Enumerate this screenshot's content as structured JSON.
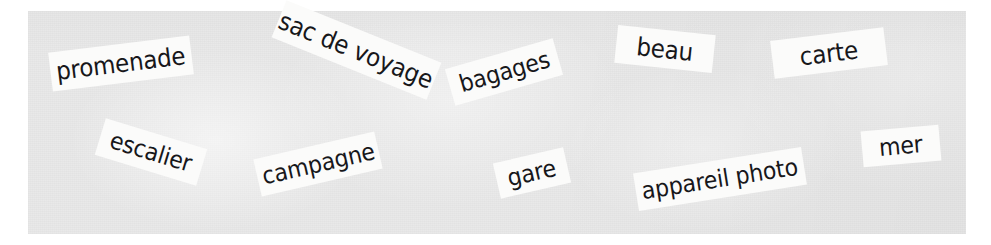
{
  "image": {
    "title": "French vocabulary word cards on grey paper",
    "background_color": "#ffffff",
    "paper_color": "#e9e9e9",
    "card_color": "#fbfbfa",
    "text_color": "#17171a"
  },
  "cards": [
    {
      "label": "promenade",
      "left": 50,
      "top": 44,
      "width": 142,
      "height": 39,
      "rotation": -7,
      "font_size": 25
    },
    {
      "label": "sac de voyage",
      "left": 273,
      "top": 30,
      "width": 167,
      "height": 40,
      "rotation": 22,
      "font_size": 25
    },
    {
      "label": "bagages",
      "left": 448,
      "top": 53,
      "width": 112,
      "height": 38,
      "rotation": -16,
      "font_size": 24
    },
    {
      "label": "beau",
      "left": 616,
      "top": 30,
      "width": 98,
      "height": 38,
      "rotation": 6,
      "font_size": 25
    },
    {
      "label": "carte",
      "left": 772,
      "top": 34,
      "width": 114,
      "height": 38,
      "rotation": -7,
      "font_size": 25
    },
    {
      "label": "escalier",
      "left": 98,
      "top": 133,
      "width": 106,
      "height": 38,
      "rotation": 17,
      "font_size": 24
    },
    {
      "label": "campagne",
      "left": 256,
      "top": 145,
      "width": 124,
      "height": 38,
      "rotation": -13,
      "font_size": 24
    },
    {
      "label": "gare",
      "left": 496,
      "top": 155,
      "width": 72,
      "height": 36,
      "rotation": -13,
      "font_size": 24
    },
    {
      "label": "appareil photo",
      "left": 635,
      "top": 160,
      "width": 170,
      "height": 38,
      "rotation": -9,
      "font_size": 24
    },
    {
      "label": "mer",
      "left": 862,
      "top": 128,
      "width": 78,
      "height": 36,
      "rotation": -5,
      "font_size": 24
    }
  ]
}
